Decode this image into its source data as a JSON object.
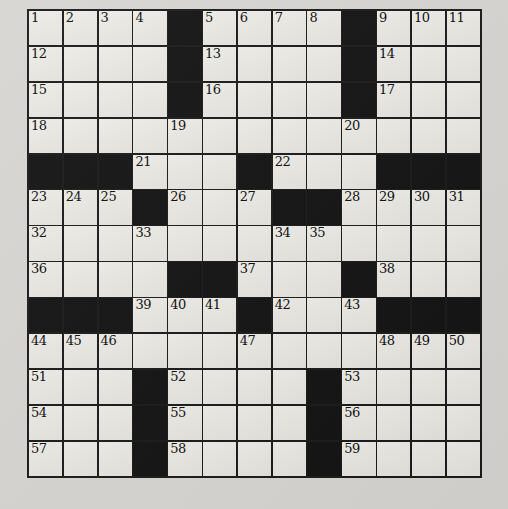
{
  "puzzle": {
    "kind": "crossword",
    "rows": 13,
    "cols": 13,
    "colors": {
      "page_background": "#d6d5d1",
      "cell_fill": "#e9e8e3",
      "black_cell": "#131313",
      "grid_line": "#1a1a1a",
      "number_color": "#0d0d0d"
    },
    "grid": [
      [
        "1",
        "2",
        "3",
        "4",
        "#",
        "5",
        "6",
        "7",
        "8",
        "#",
        "9",
        "10",
        "11"
      ],
      [
        "12",
        "",
        "",
        "",
        "#",
        "13",
        "",
        "",
        "",
        "#",
        "14",
        "",
        ""
      ],
      [
        "15",
        "",
        "",
        "",
        "#",
        "16",
        "",
        "",
        "",
        "#",
        "17",
        "",
        ""
      ],
      [
        "18",
        "",
        "",
        "",
        "19",
        "",
        "",
        "",
        "",
        "20",
        "",
        "",
        ""
      ],
      [
        "#",
        "#",
        "#",
        "21",
        "",
        "",
        "#",
        "22",
        "",
        "",
        "#",
        "#",
        "#"
      ],
      [
        "23",
        "24",
        "25",
        "#",
        "26",
        "",
        "27",
        "#",
        "#",
        "28",
        "29",
        "30",
        "31"
      ],
      [
        "32",
        "",
        "",
        "33",
        "",
        "",
        "",
        "34",
        "35",
        "",
        "",
        "",
        ""
      ],
      [
        "36",
        "",
        "",
        "",
        "#",
        "#",
        "37",
        "",
        "",
        "#",
        "38",
        "",
        ""
      ],
      [
        "#",
        "#",
        "#",
        "39",
        "40",
        "41",
        "#",
        "42",
        "",
        "43",
        "#",
        "#",
        "#"
      ],
      [
        "44",
        "45",
        "46",
        "",
        "",
        "",
        "47",
        "",
        "",
        "",
        "48",
        "49",
        "50"
      ],
      [
        "51",
        "",
        "",
        "#",
        "52",
        "",
        "",
        "",
        "#",
        "53",
        "",
        "",
        ""
      ],
      [
        "54",
        "",
        "",
        "#",
        "55",
        "",
        "",
        "",
        "#",
        "56",
        "",
        "",
        ""
      ],
      [
        "57",
        "",
        "",
        "#",
        "58",
        "",
        "",
        "",
        "#",
        "59",
        "",
        "",
        ""
      ]
    ]
  }
}
